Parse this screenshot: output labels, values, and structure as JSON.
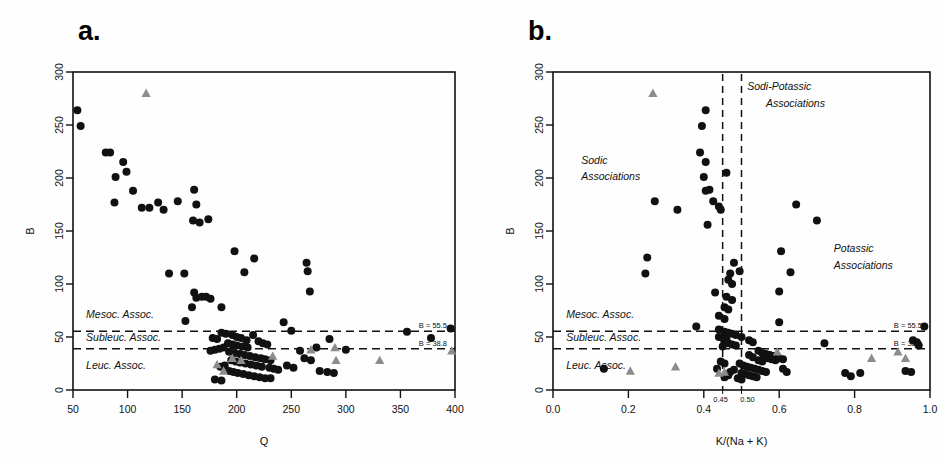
{
  "figure": {
    "background": "#fefefe",
    "circle_color": "#111111",
    "triangle_color": "#8c8c8c"
  },
  "panels": {
    "a": {
      "label": "a.",
      "xlabel": "Q",
      "ylabel": "B"
    },
    "b": {
      "label": "b.",
      "xlabel": "K/(Na + K)",
      "ylabel": "B"
    }
  },
  "chart_data": [
    {
      "type": "scatter",
      "panel": "a",
      "title": "a.",
      "xlabel": "Q",
      "ylabel": "B",
      "xlim": [
        50,
        400
      ],
      "ylim": [
        0,
        300
      ],
      "xticks": [
        50,
        100,
        150,
        200,
        250,
        300,
        350,
        400
      ],
      "xtick_labels": [
        "50",
        "100",
        "150",
        "200",
        "250",
        "300",
        "350",
        "400"
      ],
      "yticks": [
        0,
        50,
        100,
        150,
        200,
        250,
        300
      ],
      "ytick_labels": [
        "0",
        "50",
        "100",
        "150",
        "200",
        "250",
        "300"
      ],
      "grid": false,
      "legend": "none",
      "hlines": [
        {
          "y": 55.5,
          "label": "B = 55.5",
          "style": "dashed"
        },
        {
          "y": 38.8,
          "label": "B = 38.8",
          "style": "dashed"
        }
      ],
      "annotations": [
        {
          "text": "Mesoc. Assoc.",
          "x": 62,
          "y": 68,
          "italic": true
        },
        {
          "text": "Subleuc. Assoc.",
          "x": 62,
          "y": 46,
          "italic": true
        },
        {
          "text": "Leuc. Assoc.",
          "x": 62,
          "y": 20,
          "italic": true
        }
      ],
      "series": [
        {
          "name": "circles",
          "marker": "circle",
          "color": "#111111",
          "points": [
            [
              54,
              264
            ],
            [
              57,
              249
            ],
            [
              80,
              224
            ],
            [
              84,
              224
            ],
            [
              96,
              215
            ],
            [
              99,
              206
            ],
            [
              89,
              201
            ],
            [
              105,
              188
            ],
            [
              88,
              177
            ],
            [
              113,
              172
            ],
            [
              120,
              172
            ],
            [
              133,
              170
            ],
            [
              128,
              177
            ],
            [
              146,
              178
            ],
            [
              161,
              189
            ],
            [
              163,
              175
            ],
            [
              160,
              160
            ],
            [
              166,
              158
            ],
            [
              174,
              161
            ],
            [
              198,
              131
            ],
            [
              216,
              124
            ],
            [
              207,
              111
            ],
            [
              264,
              120
            ],
            [
              265,
              112
            ],
            [
              267,
              93
            ],
            [
              138,
              110
            ],
            [
              152,
              110
            ],
            [
              161,
              92
            ],
            [
              163,
              87
            ],
            [
              168,
              88
            ],
            [
              172,
              88
            ],
            [
              176,
              86
            ],
            [
              159,
              78
            ],
            [
              186,
              78
            ],
            [
              153,
              65
            ],
            [
              243,
              64
            ],
            [
              250,
              56
            ],
            [
              285,
              48
            ],
            [
              356,
              55
            ],
            [
              378,
              49
            ],
            [
              396,
              58
            ],
            [
              186,
              54
            ],
            [
              190,
              53
            ],
            [
              196,
              52
            ],
            [
              200,
              50
            ],
            [
              204,
              49
            ],
            [
              178,
              49
            ],
            [
              182,
              48
            ],
            [
              209,
              47
            ],
            [
              215,
              52
            ],
            [
              220,
              46
            ],
            [
              224,
              44
            ],
            [
              228,
              43
            ],
            [
              192,
              44
            ],
            [
              196,
              43
            ],
            [
              200,
              42
            ],
            [
              205,
              41
            ],
            [
              210,
              40
            ],
            [
              188,
              40
            ],
            [
              184,
              39
            ],
            [
              180,
              38
            ],
            [
              176,
              37
            ],
            [
              193,
              36
            ],
            [
              198,
              35
            ],
            [
              203,
              34
            ],
            [
              207,
              33
            ],
            [
              212,
              32
            ],
            [
              217,
              31
            ],
            [
              222,
              30
            ],
            [
              226,
              29
            ],
            [
              231,
              28
            ],
            [
              195,
              28
            ],
            [
              199,
              27
            ],
            [
              203,
              26
            ],
            [
              208,
              25
            ],
            [
              213,
              24
            ],
            [
              218,
              23
            ],
            [
              223,
              22
            ],
            [
              189,
              23
            ],
            [
              185,
              22
            ],
            [
              230,
              21
            ],
            [
              234,
              20
            ],
            [
              238,
              19
            ],
            [
              193,
              18
            ],
            [
              197,
              17
            ],
            [
              201,
              16
            ],
            [
              206,
              15
            ],
            [
              211,
              14
            ],
            [
              216,
              13
            ],
            [
              221,
              12
            ],
            [
              226,
              11
            ],
            [
              231,
              11
            ],
            [
              180,
              10
            ],
            [
              186,
              9
            ],
            [
              246,
              23
            ],
            [
              252,
              21
            ],
            [
              262,
              30
            ],
            [
              268,
              28
            ],
            [
              276,
              18
            ],
            [
              283,
              17
            ],
            [
              289,
              16
            ],
            [
              258,
              37
            ],
            [
              273,
              40
            ],
            [
              300,
              38
            ]
          ]
        },
        {
          "name": "triangles",
          "marker": "triangle",
          "color": "#8c8c8c",
          "points": [
            [
              117,
              280
            ],
            [
              182,
              24
            ],
            [
              188,
              18
            ],
            [
              196,
              30
            ],
            [
              204,
              28
            ],
            [
              233,
              32
            ],
            [
              268,
              38
            ],
            [
              290,
              40
            ],
            [
              291,
              28
            ],
            [
              331,
              28
            ],
            [
              397,
              37
            ]
          ]
        }
      ]
    },
    {
      "type": "scatter",
      "panel": "b",
      "title": "b.",
      "xlabel": "K/(Na + K)",
      "ylabel": "B",
      "xlim": [
        0.0,
        1.0
      ],
      "ylim": [
        0,
        300
      ],
      "xticks": [
        0.0,
        0.2,
        0.4,
        0.6,
        0.8,
        1.0
      ],
      "xtick_labels": [
        "0.0",
        "0.2",
        "0.4",
        "0.6",
        "0.8",
        "1.0"
      ],
      "xticks_minor": [
        0.45,
        0.5
      ],
      "xtick_minor_labels": [
        "0.45",
        "0.50"
      ],
      "yticks": [
        0,
        50,
        100,
        150,
        200,
        250,
        300
      ],
      "ytick_labels": [
        "0",
        "50",
        "100",
        "150",
        "200",
        "250",
        "300"
      ],
      "grid": false,
      "legend": "none",
      "hlines": [
        {
          "y": 55.5,
          "label": "B = 55.5",
          "style": "dashed"
        },
        {
          "y": 38.8,
          "label": "B = 38.8",
          "style": "dashed"
        }
      ],
      "vlines": [
        {
          "x": 0.45,
          "style": "dashed"
        },
        {
          "x": 0.5,
          "style": "dashed"
        }
      ],
      "annotations": [
        {
          "text": "Sodic",
          "x": 0.075,
          "y": 213,
          "italic": true
        },
        {
          "text": "Associations",
          "x": 0.075,
          "y": 198,
          "italic": true
        },
        {
          "text": "Sodi-Potassic",
          "x": 0.515,
          "y": 283,
          "italic": true
        },
        {
          "text": "Associations",
          "x": 0.565,
          "y": 267,
          "italic": true
        },
        {
          "text": "Potassic",
          "x": 0.745,
          "y": 130,
          "italic": true
        },
        {
          "text": "Associations",
          "x": 0.745,
          "y": 114,
          "italic": true
        },
        {
          "text": "Mesoc. Assoc.",
          "x": 0.035,
          "y": 68,
          "italic": true
        },
        {
          "text": "Subleuc. Assoc.",
          "x": 0.035,
          "y": 46,
          "italic": true
        },
        {
          "text": "Leuc. Assoc.",
          "x": 0.035,
          "y": 20,
          "italic": true
        }
      ],
      "series": [
        {
          "name": "circles",
          "marker": "circle",
          "color": "#111111",
          "points": [
            [
              0.405,
              264
            ],
            [
              0.395,
              249
            ],
            [
              0.39,
              224
            ],
            [
              0.405,
              215
            ],
            [
              0.4,
              201
            ],
            [
              0.415,
              189
            ],
            [
              0.405,
              188
            ],
            [
              0.425,
              178
            ],
            [
              0.44,
              173
            ],
            [
              0.445,
              170
            ],
            [
              0.27,
              178
            ],
            [
              0.33,
              170
            ],
            [
              0.645,
              175
            ],
            [
              0.7,
              160
            ],
            [
              0.46,
              205
            ],
            [
              0.41,
              156
            ],
            [
              0.605,
              131
            ],
            [
              0.48,
              120
            ],
            [
              0.25,
              125
            ],
            [
              0.245,
              110
            ],
            [
              0.47,
              110
            ],
            [
              0.63,
              111
            ],
            [
              0.465,
              104
            ],
            [
              0.475,
              100
            ],
            [
              0.495,
              112
            ],
            [
              0.6,
              93
            ],
            [
              0.43,
              92
            ],
            [
              0.46,
              88
            ],
            [
              0.475,
              85
            ],
            [
              0.455,
              78
            ],
            [
              0.465,
              76
            ],
            [
              0.44,
              70
            ],
            [
              0.455,
              67
            ],
            [
              0.6,
              64
            ],
            [
              0.38,
              60
            ],
            [
              0.985,
              60
            ],
            [
              0.44,
              57
            ],
            [
              0.455,
              55
            ],
            [
              0.465,
              54
            ],
            [
              0.475,
              53
            ],
            [
              0.485,
              52
            ],
            [
              0.44,
              50
            ],
            [
              0.45,
              49
            ],
            [
              0.46,
              48
            ],
            [
              0.5,
              50
            ],
            [
              0.455,
              45
            ],
            [
              0.465,
              44
            ],
            [
              0.475,
              43
            ],
            [
              0.485,
              42
            ],
            [
              0.45,
              41
            ],
            [
              0.52,
              47
            ],
            [
              0.53,
              45
            ],
            [
              0.72,
              44
            ],
            [
              0.955,
              47
            ],
            [
              0.965,
              45
            ],
            [
              0.97,
              42
            ],
            [
              0.545,
              37
            ],
            [
              0.555,
              35
            ],
            [
              0.565,
              34
            ],
            [
              0.575,
              33
            ],
            [
              0.585,
              32
            ],
            [
              0.56,
              31
            ],
            [
              0.57,
              30
            ],
            [
              0.58,
              29
            ],
            [
              0.59,
              28
            ],
            [
              0.545,
              28
            ],
            [
              0.555,
              27
            ],
            [
              0.6,
              30
            ],
            [
              0.61,
              29
            ],
            [
              0.52,
              33
            ],
            [
              0.53,
              31
            ],
            [
              0.495,
              25
            ],
            [
              0.505,
              23
            ],
            [
              0.515,
              22
            ],
            [
              0.525,
              21
            ],
            [
              0.535,
              20
            ],
            [
              0.545,
              19
            ],
            [
              0.555,
              18
            ],
            [
              0.565,
              17
            ],
            [
              0.5,
              16
            ],
            [
              0.51,
              15
            ],
            [
              0.52,
              14
            ],
            [
              0.53,
              13
            ],
            [
              0.54,
              12
            ],
            [
              0.48,
              19
            ],
            [
              0.47,
              17
            ],
            [
              0.465,
              14
            ],
            [
              0.455,
              12
            ],
            [
              0.49,
              11
            ],
            [
              0.5,
              10
            ],
            [
              0.61,
              20
            ],
            [
              0.62,
              17
            ],
            [
              0.775,
              16
            ],
            [
              0.79,
              13
            ],
            [
              0.815,
              16
            ],
            [
              0.935,
              18
            ],
            [
              0.95,
              17
            ],
            [
              0.135,
              20
            ],
            [
              0.445,
              27
            ],
            [
              0.455,
              25
            ],
            [
              0.435,
              20
            ]
          ]
        },
        {
          "name": "triangles",
          "marker": "triangle",
          "color": "#8c8c8c",
          "points": [
            [
              0.265,
              280
            ],
            [
              0.325,
              22
            ],
            [
              0.44,
              16
            ],
            [
              0.455,
              17
            ],
            [
              0.845,
              30
            ],
            [
              0.595,
              36
            ],
            [
              0.915,
              36
            ],
            [
              0.205,
              18
            ],
            [
              0.935,
              30
            ]
          ]
        }
      ]
    }
  ]
}
